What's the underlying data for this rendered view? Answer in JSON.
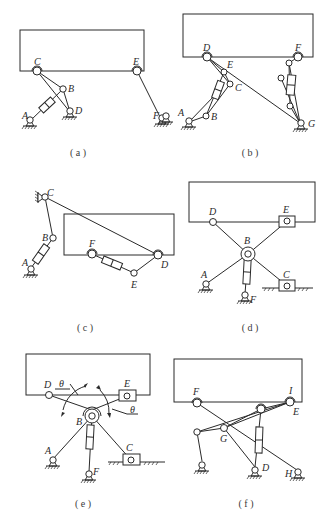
{
  "figure": {
    "panels": [
      {
        "id": "a",
        "caption": "( a )",
        "labels": {
          "A": "A",
          "B": "B",
          "C": "C",
          "D": "D",
          "E": "E",
          "F": "F"
        }
      },
      {
        "id": "b",
        "caption": "( b )",
        "labels": {
          "A": "A",
          "B": "B",
          "C": "C",
          "D": "D",
          "E": "E",
          "F": "F",
          "G": "G"
        }
      },
      {
        "id": "c",
        "caption": "( c )",
        "labels": {
          "A": "A",
          "B": "B",
          "C": "C",
          "D": "D",
          "E": "E",
          "F": "F"
        }
      },
      {
        "id": "d",
        "caption": "( d )",
        "labels": {
          "A": "A",
          "B": "B",
          "C": "C",
          "D": "D",
          "E": "E",
          "F": "F"
        }
      },
      {
        "id": "e",
        "caption": "( e )",
        "labels": {
          "A": "A",
          "B": "B",
          "C": "C",
          "D": "D",
          "E": "E",
          "F": "F",
          "theta1": "θ",
          "theta2": "θ"
        }
      },
      {
        "id": "f",
        "caption": "( f )",
        "labels": {
          "D": "D",
          "E": "E",
          "F": "F",
          "G": "G",
          "H": "H",
          "I": "I"
        }
      }
    ]
  },
  "colors": {
    "line": "#2a2a2a",
    "background": "#ffffff",
    "caption": "#3a3a3a"
  }
}
